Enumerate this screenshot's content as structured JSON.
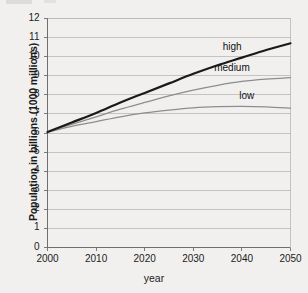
{
  "chart_data": {
    "type": "line",
    "title": "",
    "subtitle": "",
    "xlabel": "year",
    "ylabel": "Population in billions (1000 millions)",
    "xlim": [
      2000,
      2050
    ],
    "ylim": [
      0,
      12
    ],
    "x_ticks": [
      "2000",
      "2010",
      "2020",
      "2030",
      "2040",
      "2050"
    ],
    "y_ticks": [
      "0",
      "1",
      "2",
      "3",
      "4",
      "5",
      "6",
      "7",
      "8",
      "9",
      "10",
      "11",
      "12"
    ],
    "grid": "horizontal",
    "legend": "inline-labels-at-curve-ends",
    "x": [
      2000,
      2005,
      2010,
      2015,
      2020,
      2025,
      2030,
      2035,
      2040,
      2045,
      2050
    ],
    "series": [
      {
        "name": "high",
        "label": "high",
        "color": "#1a1a1a",
        "width": 2.2,
        "values": [
          6.05,
          6.55,
          7.05,
          7.6,
          8.1,
          8.6,
          9.1,
          9.55,
          9.95,
          10.35,
          10.7
        ]
      },
      {
        "name": "medium",
        "label": "medium",
        "color": "#8d8d8d",
        "width": 1.3,
        "values": [
          6.05,
          6.45,
          6.85,
          7.25,
          7.6,
          7.95,
          8.25,
          8.5,
          8.7,
          8.82,
          8.9
        ]
      },
      {
        "name": "low",
        "label": "low",
        "color": "#8d8d8d",
        "width": 1.3,
        "values": [
          6.05,
          6.35,
          6.6,
          6.85,
          7.05,
          7.2,
          7.32,
          7.38,
          7.4,
          7.37,
          7.3
        ]
      }
    ],
    "annotations": [
      {
        "text": "high",
        "x": 2038,
        "y": 10.45
      },
      {
        "text": "medium",
        "x": 2038,
        "y": 9.35
      },
      {
        "text": "low",
        "x": 2041,
        "y": 7.9
      }
    ],
    "colors": {
      "background": "#f1f0ef",
      "plot_background": "#f1f0ef",
      "grid": "#b9b8b7",
      "axis": "#6f6e6d",
      "text": "#1b1b1b",
      "high": "#1a1a1a",
      "medium": "#8d8d8d",
      "low": "#8d8d8d"
    }
  }
}
